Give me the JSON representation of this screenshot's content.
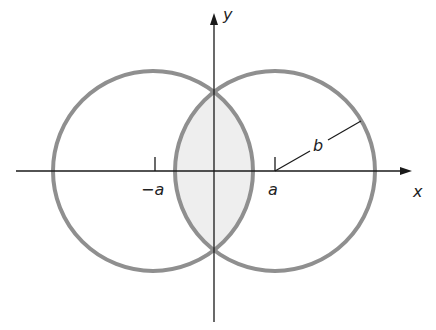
{
  "diagram": {
    "type": "two-overlapping-circles",
    "colors": {
      "circle_stroke": "#8f8f8f",
      "overlap_fill": "#eeeeee",
      "axis": "#1a1a1a",
      "text": "#222222"
    },
    "axes": {
      "x_label": "x",
      "y_label": "y"
    },
    "markers": {
      "left_center_label": "−a",
      "right_center_label": "a",
      "radius_label": "b"
    }
  }
}
